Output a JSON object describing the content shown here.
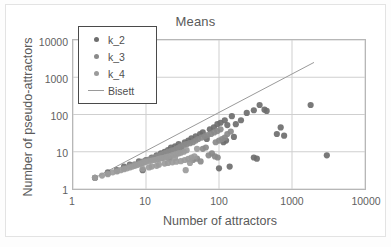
{
  "chart_data": {
    "type": "scatter",
    "title": "Means",
    "xlabel": "Number of attractors",
    "ylabel": "Number of pseudo-attractors",
    "xscale": "log",
    "yscale": "log",
    "xlim": [
      1,
      10000
    ],
    "ylim": [
      1,
      10000
    ],
    "xticks": [
      "1",
      "10",
      "100",
      "1000",
      "10000"
    ],
    "yticks": [
      "1",
      "10",
      "100",
      "1000",
      "10000"
    ],
    "grid": true,
    "legend_position": "top-left",
    "legend": [
      {
        "label": "k_2",
        "marker": "circle",
        "color": "#6e6e6e"
      },
      {
        "label": "k_3",
        "marker": "circle",
        "color": "#8a8a8a"
      },
      {
        "label": "k_4",
        "marker": "circle",
        "color": "#9b9b9b"
      },
      {
        "label": "Bisett",
        "marker": "line",
        "color": "#9a9a9a"
      }
    ],
    "series": [
      {
        "name": "k_2",
        "color": "#6e6e6e",
        "points": [
          [
            2,
            2
          ],
          [
            3,
            2.8
          ],
          [
            4,
            3.2
          ],
          [
            5,
            4
          ],
          [
            6,
            4.5
          ],
          [
            8,
            5.5
          ],
          [
            9,
            3.2
          ],
          [
            10,
            6
          ],
          [
            12,
            7
          ],
          [
            14,
            8
          ],
          [
            16,
            9
          ],
          [
            18,
            10
          ],
          [
            20,
            11
          ],
          [
            22,
            13
          ],
          [
            25,
            14
          ],
          [
            28,
            16
          ],
          [
            30,
            12
          ],
          [
            34,
            18
          ],
          [
            38,
            20
          ],
          [
            42,
            23
          ],
          [
            48,
            26
          ],
          [
            55,
            30
          ],
          [
            60,
            33
          ],
          [
            68,
            22
          ],
          [
            75,
            40
          ],
          [
            85,
            45
          ],
          [
            95,
            55
          ],
          [
            105,
            60
          ],
          [
            120,
            70
          ],
          [
            130,
            52
          ],
          [
            150,
            90
          ],
          [
            170,
            55
          ],
          [
            200,
            70
          ],
          [
            240,
            110
          ],
          [
            300,
            130
          ],
          [
            360,
            180
          ],
          [
            420,
            135
          ],
          [
            450,
            125
          ],
          [
            620,
            30
          ],
          [
            700,
            45
          ],
          [
            780,
            27
          ],
          [
            300,
            7
          ],
          [
            330,
            6.5
          ],
          [
            1800,
            180
          ],
          [
            3000,
            8
          ],
          [
            140,
            4
          ],
          [
            100,
            3.6
          ],
          [
            115,
            18
          ],
          [
            125,
            20
          ],
          [
            160,
            25
          ]
        ]
      },
      {
        "name": "k_3",
        "color": "#8a8a8a",
        "points": [
          [
            2,
            2
          ],
          [
            3,
            2.6
          ],
          [
            4,
            3
          ],
          [
            5,
            3.6
          ],
          [
            6,
            4.2
          ],
          [
            7,
            4.6
          ],
          [
            8,
            5
          ],
          [
            9,
            5.4
          ],
          [
            10,
            5.8
          ],
          [
            11,
            6.2
          ],
          [
            12,
            6.6
          ],
          [
            13,
            7
          ],
          [
            14,
            7.4
          ],
          [
            15,
            7.8
          ],
          [
            16,
            8.2
          ],
          [
            17,
            8.6
          ],
          [
            18,
            9
          ],
          [
            19,
            9.4
          ],
          [
            20,
            10
          ],
          [
            21,
            6.5
          ],
          [
            22,
            10.5
          ],
          [
            24,
            11
          ],
          [
            26,
            12
          ],
          [
            28,
            13
          ],
          [
            30,
            14
          ],
          [
            33,
            15
          ],
          [
            36,
            16
          ],
          [
            40,
            17
          ],
          [
            44,
            18
          ],
          [
            48,
            20
          ],
          [
            52,
            22
          ],
          [
            58,
            24
          ],
          [
            64,
            26
          ],
          [
            70,
            28
          ],
          [
            78,
            30
          ],
          [
            86,
            33
          ],
          [
            95,
            36
          ],
          [
            105,
            40
          ],
          [
            90,
            18
          ],
          [
            100,
            20
          ],
          [
            110,
            22
          ],
          [
            120,
            24
          ],
          [
            60,
            12
          ],
          [
            66,
            13
          ],
          [
            72,
            8
          ],
          [
            80,
            9
          ],
          [
            88,
            7.5
          ],
          [
            96,
            7
          ],
          [
            130,
            30
          ],
          [
            145,
            35
          ],
          [
            44,
            6
          ],
          [
            50,
            6.5
          ],
          [
            56,
            5.5
          ]
        ]
      },
      {
        "name": "k_4",
        "color": "#9b9b9b",
        "points": [
          [
            2,
            2
          ],
          [
            2.5,
            2.3
          ],
          [
            3,
            2.5
          ],
          [
            3.5,
            2.8
          ],
          [
            4,
            3
          ],
          [
            4.5,
            3.2
          ],
          [
            5,
            3.4
          ],
          [
            5.5,
            3.6
          ],
          [
            6,
            3.8
          ],
          [
            6.5,
            4
          ],
          [
            7,
            4.2
          ],
          [
            7.5,
            4.4
          ],
          [
            8,
            4.6
          ],
          [
            8.5,
            4.8
          ],
          [
            9,
            5
          ],
          [
            9.5,
            5.2
          ],
          [
            10,
            5.4
          ],
          [
            11,
            5.6
          ],
          [
            12,
            5.8
          ],
          [
            13,
            6
          ],
          [
            14,
            6.2
          ],
          [
            15,
            6.4
          ],
          [
            16,
            6.6
          ],
          [
            17,
            6.8
          ],
          [
            18,
            7
          ],
          [
            19,
            7.2
          ],
          [
            20,
            7.4
          ],
          [
            22,
            7.8
          ],
          [
            24,
            8.2
          ],
          [
            26,
            8.6
          ],
          [
            28,
            9
          ],
          [
            30,
            9.4
          ],
          [
            15,
            4.5
          ],
          [
            18,
            4.8
          ],
          [
            20,
            5
          ],
          [
            23,
            5.2
          ],
          [
            26,
            5.4
          ],
          [
            30,
            5.6
          ],
          [
            34,
            6
          ],
          [
            38,
            6.4
          ],
          [
            42,
            7
          ],
          [
            46,
            7.5
          ],
          [
            12,
            4
          ],
          [
            14,
            4.2
          ],
          [
            25,
            6.8
          ],
          [
            35,
            3.2
          ],
          [
            40,
            5
          ],
          [
            9,
            3.5
          ],
          [
            11,
            3.8
          ],
          [
            33,
            10
          ],
          [
            36,
            11
          ],
          [
            50,
            12
          ]
        ]
      }
    ],
    "reference_line": {
      "name": "Bisett",
      "color": "#9a9a9a",
      "from": [
        2,
        2
      ],
      "to": [
        2000,
        2500
      ]
    }
  }
}
